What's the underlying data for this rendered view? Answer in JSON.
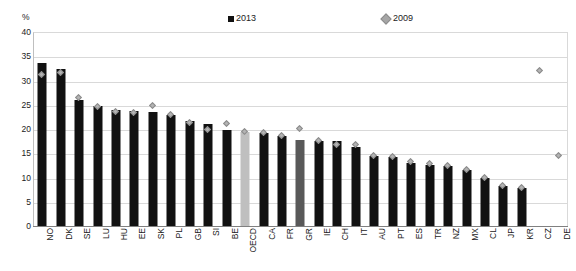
{
  "chart": {
    "type": "bar",
    "y_unit_label": "%",
    "legend": [
      {
        "key": "series-2013",
        "label": "2013",
        "marker": "filled-square",
        "color": "#111111"
      },
      {
        "key": "series-2009",
        "label": "2009",
        "marker": "diamond",
        "color": "#a6a6a6"
      }
    ]
  },
  "chart_data": {
    "type": "bar",
    "title": "",
    "xlabel": "",
    "ylabel": "%",
    "ylim": [
      0,
      40
    ],
    "yticks": [
      0,
      5,
      10,
      15,
      20,
      25,
      30,
      35,
      40
    ],
    "grid": true,
    "legend_position": "top",
    "categories": [
      "NO",
      "DK",
      "SE",
      "LU",
      "HU",
      "EE",
      "SK",
      "PL",
      "GB",
      "SI",
      "BE",
      "OECD",
      "CA",
      "FR",
      "GR",
      "IE",
      "CH",
      "IT",
      "AU",
      "PT",
      "ES",
      "TR",
      "NZ",
      "MX",
      "CL",
      "JP",
      "KR",
      "CZ",
      "DE"
    ],
    "series": [
      {
        "name": "2013",
        "marker": "bar",
        "values": [
          33.7,
          32.4,
          25.9,
          24.8,
          23.9,
          23.7,
          23.5,
          22.8,
          21.7,
          21.0,
          19.8,
          19.4,
          19.1,
          18.5,
          17.8,
          17.6,
          17.5,
          16.2,
          14.5,
          14.3,
          13.0,
          12.6,
          12.3,
          11.5,
          9.8,
          8.3,
          7.9,
          null,
          null
        ]
      },
      {
        "name": "2009",
        "marker": "diamond",
        "values": [
          31.3,
          31.7,
          26.5,
          24.6,
          23.7,
          23.5,
          24.8,
          23.0,
          21.3,
          19.8,
          21.2,
          19.4,
          19.3,
          18.6,
          20.2,
          17.6,
          16.9,
          16.9,
          14.5,
          14.3,
          13.4,
          12.8,
          12.5,
          11.7,
          10.0,
          8.3,
          7.9,
          32.0,
          14.5
        ]
      }
    ],
    "special_bar_colors": {
      "OECD": "#bfbfbf",
      "GR": "#595959"
    }
  }
}
